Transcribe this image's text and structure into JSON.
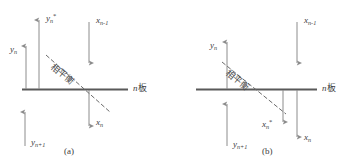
{
  "figure": {
    "type": "diagram",
    "background": "#ffffff",
    "colors": {
      "plate_line": "#595959",
      "arrow": "#8c8c8c",
      "dashed_equilibrium": "#6b6b6b",
      "text": "#3b3b3b"
    },
    "panels": [
      {
        "id": "a",
        "caption": "(a)",
        "plate_label_italic": "n",
        "plate_label_cjk": "板",
        "equilibrium_label": "相平衡",
        "arrows": [
          {
            "name": "y-n",
            "var": "y",
            "sub": "n",
            "sup": "",
            "dir": "up",
            "side": "above",
            "label_side": "left"
          },
          {
            "name": "y-n-star",
            "var": "y",
            "sub": "n",
            "sup": "*",
            "dir": "up",
            "side": "above",
            "label_side": "right"
          },
          {
            "name": "x-n-minus-1",
            "var": "x",
            "sub": "n-1",
            "sup": "",
            "dir": "down",
            "side": "above",
            "label_side": "right"
          },
          {
            "name": "y-n-plus-1",
            "var": "y",
            "sub": "n+1",
            "sup": "",
            "dir": "up",
            "side": "below",
            "label_side": "right"
          },
          {
            "name": "x-n",
            "var": "x",
            "sub": "n",
            "sup": "",
            "dir": "down",
            "side": "below",
            "label_side": "right"
          }
        ],
        "labels": {
          "y_n": "y",
          "y_n_sub": "n",
          "y_n_star": "y",
          "y_n_star_sub": "n",
          "y_n_star_sup": "*",
          "x_n_minus_1": "x",
          "x_n_minus_1_sub": "n-1",
          "y_n_plus_1": "y",
          "y_n_plus_1_sub": "n+1",
          "x_n": "x",
          "x_n_sub": "n"
        }
      },
      {
        "id": "b",
        "caption": "(b)",
        "plate_label_italic": "n",
        "plate_label_cjk": "板",
        "equilibrium_label": "相平衡",
        "arrows": [
          {
            "name": "y-n",
            "var": "y",
            "sub": "n",
            "sup": "",
            "dir": "up",
            "side": "above",
            "label_side": "left"
          },
          {
            "name": "x-n-minus-1",
            "var": "x",
            "sub": "n-1",
            "sup": "",
            "dir": "down",
            "side": "above",
            "label_side": "right"
          },
          {
            "name": "x-n-star",
            "var": "x",
            "sub": "n",
            "sup": "*",
            "dir": "down",
            "side": "below",
            "label_side": "left"
          },
          {
            "name": "x-n",
            "var": "x",
            "sub": "n",
            "sup": "",
            "dir": "down",
            "side": "below",
            "label_side": "right"
          },
          {
            "name": "y-n-plus-1",
            "var": "y",
            "sub": "n+1",
            "sup": "",
            "dir": "up",
            "side": "below",
            "label_side": "right"
          }
        ],
        "labels": {
          "y_n": "y",
          "y_n_sub": "n",
          "x_n_minus_1": "x",
          "x_n_minus_1_sub": "n-1",
          "x_n_star": "x",
          "x_n_star_sub": "n",
          "x_n_star_sup": "*",
          "x_n": "x",
          "x_n_sub": "n",
          "y_n_plus_1": "y",
          "y_n_plus_1_sub": "n+1"
        }
      }
    ]
  }
}
